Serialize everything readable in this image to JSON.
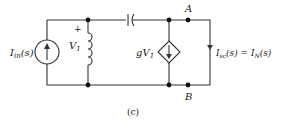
{
  "diagram": {
    "caption": "(c)",
    "source": {
      "label": "I",
      "sub": "in",
      "arg": "(s)"
    },
    "inductor": {
      "plus": "+",
      "voltage": "V",
      "sub": "1"
    },
    "dependent_source": {
      "label": "gV",
      "sub": "1"
    },
    "nodes": {
      "top": "A",
      "bottom": "B"
    },
    "output_current": {
      "label": "I",
      "sub": "sc",
      "arg": "(s) = I",
      "sub2": "N",
      "arg2": "(s)"
    }
  }
}
